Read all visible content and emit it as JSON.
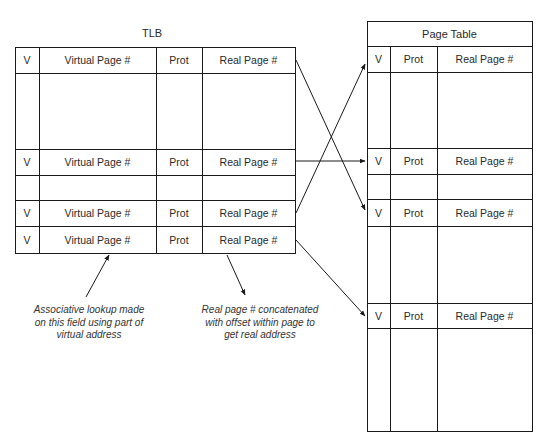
{
  "tlb": {
    "title": "TLB",
    "columns": [
      "V",
      "Virtual Page #",
      "Prot",
      "Real Page #"
    ],
    "rows": [
      {
        "v": "",
        "vpn": "",
        "prot": "",
        "rpn": "",
        "kind": "empty"
      },
      {
        "v": "V",
        "vpn": "Virtual Page #",
        "prot": "Prot",
        "rpn": "Real Page #",
        "kind": "entry"
      },
      {
        "v": "",
        "vpn": "",
        "prot": "",
        "rpn": "",
        "kind": "empty"
      },
      {
        "v": "V",
        "vpn": "Virtual Page #",
        "prot": "Prot",
        "rpn": "Real Page #",
        "kind": "entry"
      },
      {
        "v": "V",
        "vpn": "Virtual Page #",
        "prot": "Prot",
        "rpn": "Real Page #",
        "kind": "entry"
      }
    ],
    "header": {
      "v": "V",
      "vpn": "Virtual Page #",
      "prot": "Prot",
      "rpn": "Real Page #"
    }
  },
  "page_table": {
    "title": "Page Table",
    "columns": [
      "V",
      "Prot",
      "Real Page #"
    ],
    "header": {
      "v": "V",
      "prot": "Prot",
      "rpn": "Real Page #"
    },
    "entries": [
      {
        "v": "V",
        "prot": "Prot",
        "rpn": "Real Page #"
      },
      {
        "v": "V",
        "prot": "Prot",
        "rpn": "Real Page #"
      },
      {
        "v": "V",
        "prot": "Prot",
        "rpn": "Real Page #"
      }
    ]
  },
  "annotations": {
    "lookup": [
      "Associative lookup made",
      "on this field using part of",
      "virtual address"
    ],
    "concat": [
      "Real page # concatenated",
      "with offset within page to",
      "get real address"
    ]
  },
  "colors": {
    "line": "#1a1a1a",
    "text": "#2a2a2a",
    "background": "#ffffff"
  }
}
